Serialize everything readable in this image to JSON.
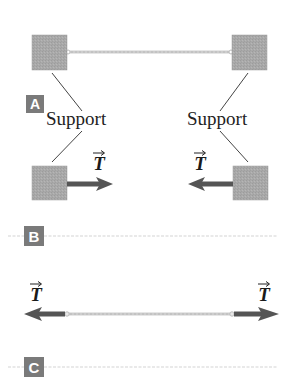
{
  "panels": [
    {
      "badge": "A",
      "labels": {
        "left_support": "Support",
        "right_support": "Support"
      }
    },
    {
      "badge": "B",
      "labels": {
        "left_tension": "T",
        "right_tension": "T"
      }
    },
    {
      "badge": "C",
      "labels": {
        "left_tension": "T",
        "right_tension": "T"
      }
    }
  ],
  "colors": {
    "block": "#a8a8a8",
    "rope": "#cfcfcf",
    "arrow": "#5a5a5a",
    "badge": "#7a7a7a",
    "divider": "#d6d6d6",
    "leader": "#444444"
  }
}
